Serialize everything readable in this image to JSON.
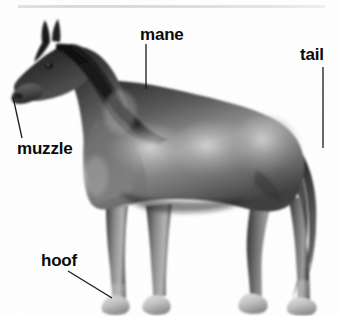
{
  "figure": {
    "style": "grayscale photograph with anatomy callout labels",
    "background_color": "#ffffff",
    "label_color": "#0b0b0b",
    "leader_line_color": "#1a1a1a",
    "rule_color": "#dcdcdc"
  },
  "labels": {
    "mane": "mane",
    "tail": "tail",
    "muzzle": "muzzle",
    "hoof": "hoof"
  },
  "icons": {
    "top_rule": "horizontal-rule",
    "leader_mane": "leader-line-icon",
    "leader_tail": "leader-line-icon",
    "leader_muzzle": "leader-line-icon",
    "leader_hoof": "leader-line-icon"
  }
}
